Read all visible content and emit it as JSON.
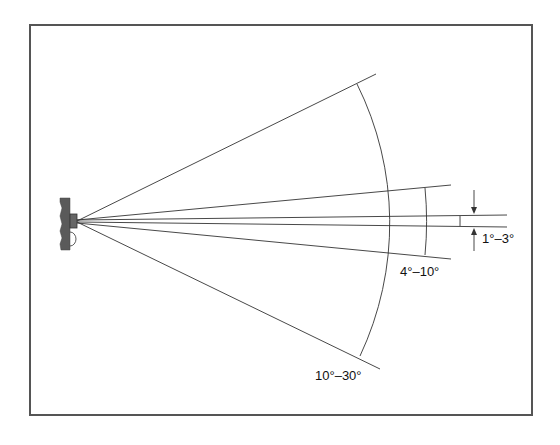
{
  "figure": {
    "type": "beam-angle-diagram",
    "labels": {
      "narrow": "1°–3°",
      "medium": "4°–10°",
      "wide": "10°–30°"
    },
    "colors": {
      "frame": "#555555",
      "lines": "#333333",
      "wall": "#5a5a5a",
      "text": "#111111"
    }
  }
}
